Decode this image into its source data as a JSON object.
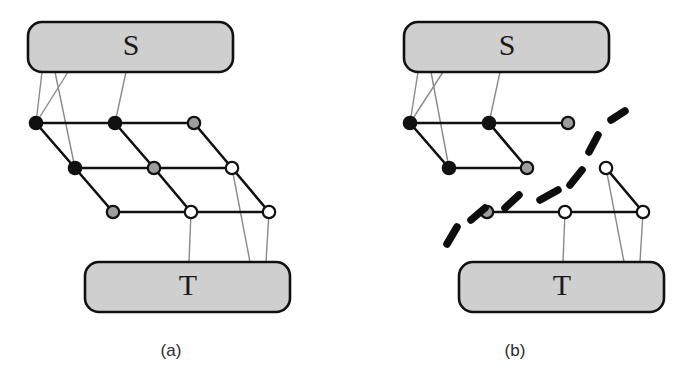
{
  "figure": {
    "width": 686,
    "height": 376,
    "background": "#ffffff",
    "panels": [
      {
        "id": "panel-a",
        "caption": "(a)",
        "caption_pos": {
          "x": 171,
          "y": 356
        },
        "source_box": {
          "label": "S",
          "x": 28,
          "y": 22,
          "w": 205,
          "h": 50,
          "r": 14,
          "fill": "#cfcfcf",
          "stroke": "#111111",
          "label_pos": {
            "x": 131,
            "y": 48
          }
        },
        "target_box": {
          "label": "T",
          "x": 85,
          "y": 262,
          "w": 205,
          "h": 50,
          "r": 14,
          "fill": "#cfcfcf",
          "stroke": "#111111",
          "label_pos": {
            "x": 188,
            "y": 288
          }
        },
        "nodes": [
          {
            "id": "a-r0c0",
            "x": 36,
            "y": 123,
            "fill": "black"
          },
          {
            "id": "a-r0c1",
            "x": 115,
            "y": 123,
            "fill": "black"
          },
          {
            "id": "a-r0c2",
            "x": 194,
            "y": 123,
            "fill": "gray"
          },
          {
            "id": "a-r1c0",
            "x": 75,
            "y": 168,
            "fill": "black"
          },
          {
            "id": "a-r1c1",
            "x": 154,
            "y": 168,
            "fill": "gray"
          },
          {
            "id": "a-r1c2",
            "x": 232,
            "y": 168,
            "fill": "white"
          },
          {
            "id": "a-r2c0",
            "x": 113,
            "y": 212,
            "fill": "gray"
          },
          {
            "id": "a-r2c1",
            "x": 191,
            "y": 212,
            "fill": "white"
          },
          {
            "id": "a-r2c2",
            "x": 269,
            "y": 212,
            "fill": "white"
          }
        ],
        "edges": [
          [
            "a-r0c0",
            "a-r0c1"
          ],
          [
            "a-r0c1",
            "a-r0c2"
          ],
          [
            "a-r1c0",
            "a-r1c1"
          ],
          [
            "a-r1c1",
            "a-r1c2"
          ],
          [
            "a-r2c0",
            "a-r2c1"
          ],
          [
            "a-r2c1",
            "a-r2c2"
          ],
          [
            "a-r0c0",
            "a-r1c0"
          ],
          [
            "a-r1c0",
            "a-r2c0"
          ],
          [
            "a-r0c1",
            "a-r1c1"
          ],
          [
            "a-r1c1",
            "a-r2c1"
          ],
          [
            "a-r0c2",
            "a-r1c2"
          ],
          [
            "a-r1c2",
            "a-r2c2"
          ]
        ],
        "links": [
          {
            "from": {
              "x": 42,
              "y": 72
            },
            "to": {
              "x": 36,
              "y": 123
            }
          },
          {
            "from": {
              "x": 55,
              "y": 72
            },
            "to": {
              "x": 75,
              "y": 168
            }
          },
          {
            "from": {
              "x": 68,
              "y": 72
            },
            "to": {
              "x": 36,
              "y": 123
            }
          },
          {
            "from": {
              "x": 126,
              "y": 72
            },
            "to": {
              "x": 115,
              "y": 123
            }
          },
          {
            "from": {
              "x": 191,
              "y": 212
            },
            "to": {
              "x": 189,
              "y": 262
            }
          },
          {
            "from": {
              "x": 232,
              "y": 168
            },
            "to": {
              "x": 250,
              "y": 262
            }
          },
          {
            "from": {
              "x": 269,
              "y": 212
            },
            "to": {
              "x": 266,
              "y": 262
            }
          }
        ],
        "dashes": []
      },
      {
        "id": "panel-b",
        "caption": "(b)",
        "caption_pos": {
          "x": 515,
          "y": 356
        },
        "source_box": {
          "label": "S",
          "x": 404,
          "y": 22,
          "w": 205,
          "h": 50,
          "r": 14,
          "fill": "#cfcfcf",
          "stroke": "#111111",
          "label_pos": {
            "x": 507,
            "y": 48
          }
        },
        "target_box": {
          "label": "T",
          "x": 459,
          "y": 262,
          "w": 205,
          "h": 50,
          "r": 14,
          "fill": "#cfcfcf",
          "stroke": "#111111",
          "label_pos": {
            "x": 562,
            "y": 288
          }
        },
        "nodes": [
          {
            "id": "b-r0c0",
            "x": 410,
            "y": 123,
            "fill": "black"
          },
          {
            "id": "b-r0c1",
            "x": 489,
            "y": 123,
            "fill": "black"
          },
          {
            "id": "b-r0c2",
            "x": 568,
            "y": 123,
            "fill": "gray"
          },
          {
            "id": "b-r1c0",
            "x": 449,
            "y": 168,
            "fill": "black"
          },
          {
            "id": "b-r1c1",
            "x": 527,
            "y": 168,
            "fill": "gray"
          },
          {
            "id": "b-r1c2",
            "x": 606,
            "y": 168,
            "fill": "white"
          },
          {
            "id": "b-r2c0",
            "x": 487,
            "y": 212,
            "fill": "gray"
          },
          {
            "id": "b-r2c1",
            "x": 565,
            "y": 212,
            "fill": "white"
          },
          {
            "id": "b-r2c2",
            "x": 643,
            "y": 212,
            "fill": "white"
          }
        ],
        "edges": [
          [
            "b-r0c0",
            "b-r0c1"
          ],
          [
            "b-r0c1",
            "b-r0c2"
          ],
          [
            "b-r1c0",
            "b-r1c1"
          ],
          [
            "b-r2c0",
            "b-r2c1"
          ],
          [
            "b-r2c1",
            "b-r2c2"
          ],
          [
            "b-r0c0",
            "b-r1c0"
          ],
          [
            "b-r0c1",
            "b-r1c1"
          ],
          [
            "b-r1c2",
            "b-r2c2"
          ]
        ],
        "links": [
          {
            "from": {
              "x": 418,
              "y": 72
            },
            "to": {
              "x": 410,
              "y": 123
            }
          },
          {
            "from": {
              "x": 431,
              "y": 72
            },
            "to": {
              "x": 449,
              "y": 168
            }
          },
          {
            "from": {
              "x": 443,
              "y": 72
            },
            "to": {
              "x": 410,
              "y": 123
            }
          },
          {
            "from": {
              "x": 500,
              "y": 72
            },
            "to": {
              "x": 489,
              "y": 123
            }
          },
          {
            "from": {
              "x": 565,
              "y": 212
            },
            "to": {
              "x": 563,
              "y": 262
            }
          },
          {
            "from": {
              "x": 606,
              "y": 168
            },
            "to": {
              "x": 624,
              "y": 262
            }
          },
          {
            "from": {
              "x": 643,
              "y": 212
            },
            "to": {
              "x": 640,
              "y": 262
            }
          }
        ],
        "dashes": [
          {
            "x1": 611,
            "y1": 120,
            "x2": 625,
            "y2": 111
          },
          {
            "x1": 589,
            "y1": 152,
            "x2": 598,
            "y2": 135
          },
          {
            "x1": 570,
            "y1": 185,
            "x2": 582,
            "y2": 170
          },
          {
            "x1": 540,
            "y1": 200,
            "x2": 558,
            "y2": 190
          },
          {
            "x1": 505,
            "y1": 208,
            "x2": 519,
            "y2": 195
          },
          {
            "x1": 471,
            "y1": 220,
            "x2": 485,
            "y2": 208
          },
          {
            "x1": 447,
            "y1": 244,
            "x2": 457,
            "y2": 227
          }
        ]
      }
    ]
  }
}
